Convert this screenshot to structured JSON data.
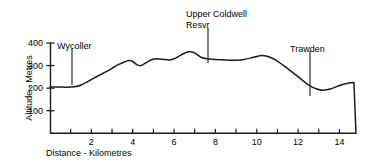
{
  "chart_data": {
    "type": "area",
    "title": "",
    "subtitle": "",
    "xlabel": "Distance - Kilometres",
    "ylabel": "Altitude - Metres",
    "xlim": [
      0,
      14.8
    ],
    "ylim": [
      0,
      420
    ],
    "grid": false,
    "legend": "none",
    "x_ticks": [
      0,
      1,
      2,
      3,
      4,
      5,
      6,
      7,
      8,
      9,
      10,
      11,
      12,
      13,
      14
    ],
    "x_tick_labels": [
      "",
      "",
      "2",
      "",
      "4",
      "",
      "6",
      "",
      "8",
      "",
      "10",
      "",
      "12",
      "",
      "14"
    ],
    "y_ticks": [
      100,
      200,
      300,
      400
    ],
    "y_tick_labels": [
      "100",
      "200",
      "300",
      "400"
    ],
    "series": [
      {
        "name": "Elevation profile",
        "x": [
          0.0,
          0.4,
          0.8,
          1.2,
          1.5,
          1.8,
          2.1,
          2.4,
          2.7,
          3.0,
          3.3,
          3.6,
          3.8,
          4.0,
          4.2,
          4.4,
          4.6,
          4.9,
          5.2,
          5.5,
          5.8,
          6.1,
          6.4,
          6.7,
          7.0,
          7.3,
          7.6,
          8.0,
          8.5,
          9.0,
          9.4,
          9.8,
          10.2,
          10.5,
          10.9,
          11.3,
          11.7,
          12.1,
          12.5,
          12.9,
          13.2,
          13.6,
          14.0,
          14.4,
          14.7,
          14.8
        ],
        "y": [
          205,
          205,
          204,
          206,
          214,
          228,
          243,
          258,
          272,
          288,
          304,
          316,
          322,
          318,
          304,
          300,
          310,
          326,
          330,
          327,
          325,
          334,
          350,
          361,
          356,
          337,
          330,
          327,
          325,
          324,
          327,
          336,
          345,
          341,
          325,
          300,
          272,
          243,
          215,
          196,
          191,
          197,
          212,
          222,
          225,
          0
        ]
      }
    ],
    "annotations": [
      {
        "id": "wycoller",
        "text": "Wycoller",
        "x_km": 1.1,
        "label_x": 57,
        "label_y": 42,
        "line_x": 72,
        "line_y_top": 48,
        "line_y_bottom": 85
      },
      {
        "id": "upper-coldwell-resvr",
        "text": "Upper Coldwell",
        "text2": "Resvr",
        "x_km": 8.0,
        "label_x": 186,
        "label_y": 10,
        "line_x": 208,
        "line_y_top": 28,
        "line_y_bottom": 63
      },
      {
        "id": "trawden",
        "text": "Trawden",
        "x_km": 13.0,
        "label_x": 290,
        "label_y": 45,
        "line_x": 310,
        "line_y_top": 51,
        "line_y_bottom": 96
      }
    ]
  },
  "axes": {
    "x_title": "Distance - Kilometres",
    "y_title": "Altitude - Metres"
  },
  "colors": {
    "line": "#1a1a1a",
    "axis": "#1a1a1a",
    "background": "#ffffff",
    "text": "#000000"
  }
}
